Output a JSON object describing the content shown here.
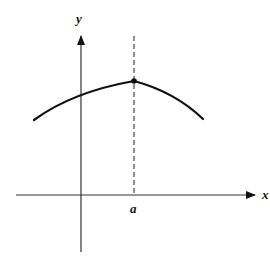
{
  "figure": {
    "axes": {
      "x_label": "x",
      "y_label": "y"
    },
    "marker_label": "a",
    "colors": {
      "line": "#111111",
      "axis": "#333333",
      "background": "#ffffff"
    }
  },
  "geometry": {
    "x_axis": {
      "x1": 16,
      "y": 195,
      "x2": 257
    },
    "y_axis": {
      "x": 81,
      "y1": 252,
      "y2": 34
    },
    "dashed_line": {
      "x": 134,
      "y1": 36,
      "y2": 195
    },
    "peak": {
      "x": 134,
      "y": 81
    },
    "curve_left_end": {
      "x": 34,
      "y": 120
    },
    "curve_right_end": {
      "x": 203,
      "y": 119
    }
  }
}
